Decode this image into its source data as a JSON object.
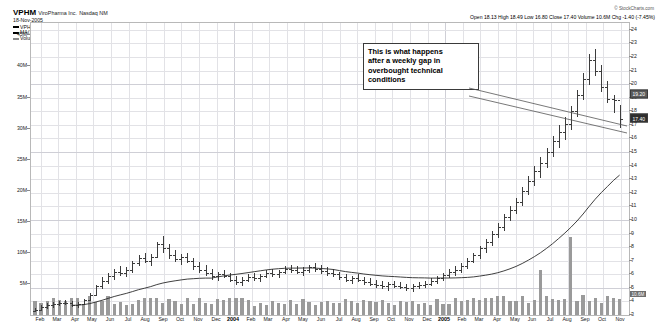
{
  "header": {
    "symbol": "VPHM",
    "company": "ViroPharma Inc.",
    "exchange": "Nasdaq NM",
    "date": "18-Nov-2005",
    "series_label": "VPHM (Weekly) 17.40",
    "ma_label": "MA(30) 15.60",
    "volume_label": "Volume 10,642,406",
    "watermark": "© StockCharts.com"
  },
  "quote": {
    "text": "Open 18.13 High 18.49 Low 16.80 Close 17.40 Volume 10.6M Chg -1.40 (-7.45%)",
    "open": "18.13",
    "high": "18.49",
    "low": "16.80",
    "close": "17.40",
    "volume": "10.6M",
    "change": "-1.40 (-7.45%)"
  },
  "annotation": {
    "lines": [
      "This is what happens",
      "after a weekly gap in",
      "overbought technical",
      "conditions"
    ]
  },
  "markers": {
    "ma_value": "19.20",
    "close_value": "17.40",
    "close_sub": "17",
    "volume_value": "10.6M"
  },
  "chart_data": {
    "type": "line",
    "title": "VPHM ViroPharma Inc. Nasdaq NM",
    "subtitle": "18-Nov-2005",
    "xlabel": "",
    "ylabel": "Price",
    "grid": true,
    "legend": "top-left",
    "price_axis": {
      "side": "right",
      "ylim": [
        3,
        24.5
      ],
      "ticks": [
        24,
        23,
        22,
        21,
        20,
        19,
        18,
        17,
        16,
        15,
        14,
        13,
        12,
        11,
        10,
        9,
        8,
        7,
        6,
        5,
        4,
        3
      ]
    },
    "volume_axis": {
      "side": "left",
      "ylim": [
        0,
        47
      ],
      "unit": "M",
      "ticks": [
        "45M",
        "40M",
        "35M",
        "30M",
        "25M",
        "20M",
        "15M",
        "10M",
        "5M"
      ]
    },
    "x_ticks": [
      "Feb",
      "Mar",
      "Apr",
      "May",
      "Jun",
      "Jul",
      "Aug",
      "Sep",
      "Oct",
      "Nov",
      "Dec",
      "2004",
      "Feb",
      "Mar",
      "Apr",
      "May",
      "Jun",
      "Jul",
      "Aug",
      "Sep",
      "Oct",
      "Nov",
      "Dec",
      "2005",
      "Feb",
      "Mar",
      "Apr",
      "May",
      "Jun",
      "Jul",
      "Aug",
      "Sep",
      "Oct",
      "Nov"
    ],
    "series": [
      {
        "name": "VPHM (Weekly)",
        "type": "ohlc",
        "last_value": 17.4,
        "ohlc": [
          [
            3.3,
            3.55,
            3.2,
            3.4
          ],
          [
            3.4,
            3.7,
            3.3,
            3.6
          ],
          [
            3.6,
            3.85,
            3.45,
            3.7
          ],
          [
            3.7,
            3.95,
            3.55,
            3.8
          ],
          [
            3.8,
            4.05,
            3.65,
            3.9
          ],
          [
            3.9,
            4.1,
            3.7,
            3.85
          ],
          [
            3.85,
            4.0,
            3.6,
            3.75
          ],
          [
            3.75,
            3.95,
            3.55,
            3.8
          ],
          [
            3.8,
            4.2,
            3.7,
            4.1
          ],
          [
            4.1,
            4.6,
            4.0,
            4.5
          ],
          [
            4.5,
            5.2,
            4.4,
            5.1
          ],
          [
            5.1,
            5.8,
            4.9,
            5.5
          ],
          [
            5.5,
            6.1,
            5.3,
            5.9
          ],
          [
            5.9,
            6.4,
            5.6,
            6.2
          ],
          [
            6.2,
            6.6,
            5.9,
            6.1
          ],
          [
            6.1,
            6.5,
            5.8,
            6.3
          ],
          [
            6.3,
            7.0,
            6.1,
            6.8
          ],
          [
            6.8,
            7.4,
            6.6,
            7.2
          ],
          [
            7.2,
            7.6,
            6.8,
            7.0
          ],
          [
            7.0,
            7.5,
            6.6,
            7.3
          ],
          [
            7.3,
            8.4,
            7.2,
            8.2
          ],
          [
            8.2,
            8.8,
            7.6,
            7.9
          ],
          [
            7.9,
            8.2,
            7.1,
            7.4
          ],
          [
            7.4,
            7.8,
            6.9,
            7.1
          ],
          [
            7.1,
            7.5,
            6.7,
            7.3
          ],
          [
            7.3,
            7.6,
            6.8,
            6.95
          ],
          [
            6.95,
            7.2,
            6.3,
            6.6
          ],
          [
            6.6,
            6.9,
            6.1,
            6.35
          ],
          [
            6.35,
            6.7,
            5.9,
            6.1
          ],
          [
            6.1,
            6.4,
            5.6,
            5.85
          ],
          [
            5.85,
            6.2,
            5.5,
            6.0
          ],
          [
            6.0,
            6.3,
            5.7,
            5.9
          ],
          [
            5.9,
            6.1,
            5.4,
            5.6
          ],
          [
            5.6,
            5.9,
            5.2,
            5.45
          ],
          [
            5.45,
            5.8,
            5.1,
            5.6
          ],
          [
            5.6,
            6.0,
            5.4,
            5.8
          ],
          [
            5.8,
            6.1,
            5.5,
            5.7
          ],
          [
            5.7,
            6.0,
            5.4,
            5.9
          ],
          [
            5.9,
            6.3,
            5.7,
            6.1
          ],
          [
            6.1,
            6.4,
            5.8,
            6.0
          ],
          [
            6.0,
            6.3,
            5.7,
            6.2
          ],
          [
            6.2,
            6.6,
            6.0,
            6.4
          ],
          [
            6.4,
            6.7,
            6.1,
            6.3
          ],
          [
            6.3,
            6.6,
            6.0,
            6.2
          ],
          [
            6.2,
            6.5,
            5.9,
            6.35
          ],
          [
            6.35,
            6.7,
            6.1,
            6.5
          ],
          [
            6.5,
            6.8,
            6.2,
            6.4
          ],
          [
            6.4,
            6.7,
            6.0,
            6.25
          ],
          [
            6.25,
            6.5,
            5.9,
            6.1
          ],
          [
            6.1,
            6.4,
            5.8,
            6.0
          ],
          [
            6.0,
            6.2,
            5.6,
            5.8
          ],
          [
            5.8,
            6.0,
            5.4,
            5.6
          ],
          [
            5.6,
            5.9,
            5.3,
            5.7
          ],
          [
            5.7,
            6.0,
            5.4,
            5.55
          ],
          [
            5.55,
            5.8,
            5.2,
            5.4
          ],
          [
            5.4,
            5.7,
            5.1,
            5.3
          ],
          [
            5.3,
            5.6,
            5.0,
            5.2
          ],
          [
            5.2,
            5.5,
            4.9,
            5.1
          ],
          [
            5.1,
            5.4,
            4.8,
            5.25
          ],
          [
            5.25,
            5.5,
            5.0,
            5.15
          ],
          [
            5.15,
            5.4,
            4.9,
            5.05
          ],
          [
            5.05,
            5.3,
            4.8,
            5.0
          ],
          [
            5.0,
            5.3,
            4.7,
            5.1
          ],
          [
            5.1,
            5.4,
            4.9,
            5.2
          ],
          [
            5.2,
            5.5,
            5.0,
            5.3
          ],
          [
            5.3,
            5.7,
            5.1,
            5.5
          ],
          [
            5.5,
            5.9,
            5.3,
            5.7
          ],
          [
            5.7,
            6.1,
            5.5,
            5.95
          ],
          [
            5.95,
            6.4,
            5.7,
            6.2
          ],
          [
            6.2,
            6.6,
            5.9,
            6.3
          ],
          [
            6.3,
            6.8,
            6.1,
            6.6
          ],
          [
            6.6,
            7.2,
            6.4,
            7.0
          ],
          [
            7.0,
            7.6,
            6.8,
            7.4
          ],
          [
            7.4,
            8.1,
            7.1,
            7.9
          ],
          [
            7.9,
            8.6,
            7.6,
            8.4
          ],
          [
            8.4,
            9.2,
            8.1,
            9.0
          ],
          [
            9.0,
            9.8,
            8.7,
            9.5
          ],
          [
            9.5,
            10.4,
            9.2,
            10.2
          ],
          [
            10.2,
            11.0,
            9.9,
            10.7
          ],
          [
            10.7,
            11.6,
            10.4,
            11.3
          ],
          [
            11.3,
            12.4,
            11.0,
            12.1
          ],
          [
            12.1,
            13.2,
            11.8,
            12.9
          ],
          [
            12.9,
            14.0,
            12.5,
            13.6
          ],
          [
            13.6,
            14.6,
            13.1,
            14.2
          ],
          [
            14.2,
            15.3,
            13.8,
            15.0
          ],
          [
            15.0,
            16.2,
            14.6,
            15.8
          ],
          [
            15.8,
            17.0,
            15.3,
            16.5
          ],
          [
            16.5,
            17.6,
            15.9,
            17.1
          ],
          [
            17.1,
            18.4,
            16.6,
            18.0
          ],
          [
            18.0,
            19.6,
            17.6,
            19.2
          ],
          [
            19.2,
            20.8,
            18.8,
            20.4
          ],
          [
            20.4,
            22.2,
            19.9,
            21.8
          ],
          [
            21.8,
            22.6,
            20.6,
            21.0
          ],
          [
            21.0,
            21.4,
            19.4,
            19.8
          ],
          [
            19.8,
            20.2,
            18.6,
            18.9
          ],
          [
            18.9,
            19.2,
            17.9,
            18.8
          ],
          [
            18.8,
            18.49,
            16.8,
            17.4
          ]
        ]
      },
      {
        "name": "MA(30)",
        "type": "line",
        "last_value": 15.6,
        "color": "#000000"
      },
      {
        "name": "Volume",
        "type": "bar",
        "last_value": "10,642,406",
        "color": "#9a9a9a"
      }
    ]
  }
}
